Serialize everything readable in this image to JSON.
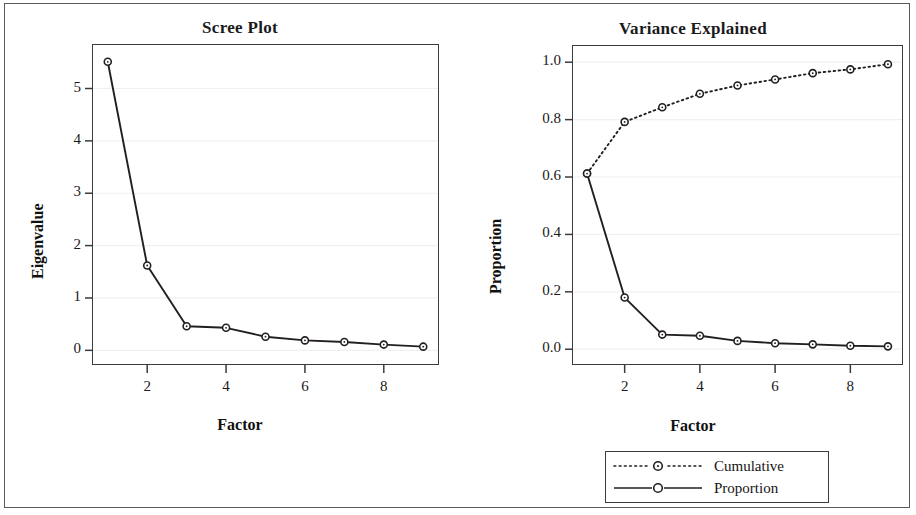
{
  "figure": {
    "width": 916,
    "height": 515,
    "background": "#ffffff",
    "border_color": "#5a5a5a",
    "line_color": "#231f20",
    "marker_fill": "#ffffff"
  },
  "chart_data": [
    {
      "type": "line",
      "panel": "left",
      "title": "Scree Plot",
      "xlabel": "Factor",
      "ylabel": "Eigenvalue",
      "x": [
        1,
        2,
        3,
        4,
        5,
        6,
        7,
        8,
        9
      ],
      "values": [
        5.51,
        1.62,
        0.46,
        0.43,
        0.26,
        0.19,
        0.16,
        0.11,
        0.07
      ],
      "series": [
        {
          "name": "Eigenvalue",
          "style": "solid",
          "marker": "open-circle",
          "values": [
            5.51,
            1.62,
            0.46,
            0.43,
            0.26,
            0.19,
            0.16,
            0.11,
            0.07
          ]
        }
      ],
      "xlim": [
        0.6,
        9.4
      ],
      "ylim": [
        -0.28,
        5.85
      ],
      "xticks": [
        2,
        4,
        6,
        8
      ],
      "xticklabels": [
        "2",
        "4",
        "6",
        "8"
      ],
      "yticks": [
        0,
        1,
        2,
        3,
        4,
        5
      ],
      "yticklabels": [
        "0",
        "1",
        "2",
        "3",
        "4",
        "5"
      ],
      "grid": "horizontal",
      "legend": false
    },
    {
      "type": "line",
      "panel": "right",
      "title": "Variance Explained",
      "xlabel": "Factor",
      "ylabel": "Proportion",
      "x": [
        1,
        2,
        3,
        4,
        5,
        6,
        7,
        8,
        9
      ],
      "series": [
        {
          "name": "Cumulative",
          "style": "dotted",
          "marker": "open-circle",
          "values": [
            0.612,
            0.792,
            0.843,
            0.89,
            0.919,
            0.94,
            0.962,
            0.975,
            0.993
          ]
        },
        {
          "name": "Proportion",
          "style": "solid",
          "marker": "open-circle",
          "values": [
            0.612,
            0.18,
            0.051,
            0.047,
            0.029,
            0.021,
            0.017,
            0.012,
            0.01
          ]
        }
      ],
      "xlim": [
        0.6,
        9.4
      ],
      "ylim": [
        -0.055,
        1.06
      ],
      "xticks": [
        2,
        4,
        6,
        8
      ],
      "xticklabels": [
        "2",
        "4",
        "6",
        "8"
      ],
      "yticks": [
        0.0,
        0.2,
        0.4,
        0.6,
        0.8,
        1.0
      ],
      "yticklabels": [
        "0.0",
        "0.2",
        "0.4",
        "0.6",
        "0.8",
        "1.0"
      ],
      "grid": "horizontal",
      "legend": true,
      "legend_position": "below-right",
      "legend_entries": [
        {
          "label": "Cumulative",
          "style": "dotted",
          "marker": "open-circle"
        },
        {
          "label": "Proportion",
          "style": "solid",
          "marker": "open-circle"
        }
      ]
    }
  ]
}
